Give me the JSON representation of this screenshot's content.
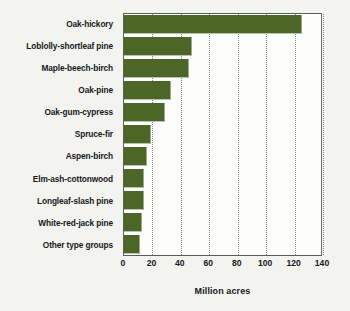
{
  "chart_data": {
    "type": "bar",
    "orientation": "horizontal",
    "title": "",
    "subtitle": "",
    "xlabel": "Million acres",
    "ylabel": "",
    "xlim": [
      0,
      140
    ],
    "xticks": [
      0,
      20,
      40,
      60,
      80,
      100,
      120,
      140
    ],
    "xtick_labels": [
      "0",
      "20",
      "40",
      "60",
      "80",
      "100",
      "120",
      "140"
    ],
    "grid": "vertical-dotted",
    "legend": "none",
    "bar_color": "#4c6628",
    "plot_background": "#fdfdfb",
    "figure_background": "#f3f3f0",
    "categories": [
      "Oak-hickory",
      "Loblolly-shortleaf pine",
      "Maple-beech-birch",
      "Oak-pine",
      "Oak-gum-cypress",
      "Spruce-fir",
      "Aspen-birch",
      "Elm-ash-cottonwood",
      "Longleaf-slash pine",
      "White-red-jack pine",
      "Other type groups"
    ],
    "values": [
      125,
      48,
      46,
      33,
      29,
      19,
      16,
      14,
      14,
      13,
      11
    ]
  }
}
